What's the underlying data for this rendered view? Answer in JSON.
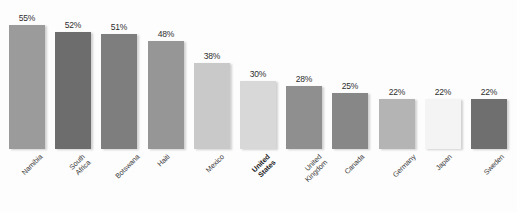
{
  "chart_data": {
    "type": "bar",
    "title": "",
    "subtitle": "",
    "xlabel": "",
    "ylabel": "",
    "ylim": [
      0,
      58
    ],
    "grid": false,
    "legend": "none",
    "orientation": "vertical",
    "value_label_suffix": "%",
    "categories": [
      "Namibia",
      "South Africa",
      "Botswana",
      "Haiti",
      "Mexico",
      "United States",
      "United Kingdom",
      "Canada",
      "Germany",
      "Japan",
      "Sweden"
    ],
    "values": [
      55,
      52,
      51,
      48,
      38,
      30,
      28,
      25,
      22,
      22,
      22
    ],
    "value_labels": [
      "55%",
      "52%",
      "51%",
      "48%",
      "38%",
      "30%",
      "28%",
      "25%",
      "22%",
      "22%",
      "22%"
    ],
    "bar_colors": [
      "#9b9b9b",
      "#6d6d6d",
      "#7e7e7e",
      "#969696",
      "#c9c9c9",
      "#d8d8d8",
      "#8f8f8f",
      "#878787",
      "#b4b4b4",
      "#f4f4f4",
      "#6f6f6f"
    ],
    "highlighted_category": "United States",
    "background_color": "#fdfdfd",
    "value_label_color": "#2e2e2e",
    "axis_label_color": "#3a3a3a"
  }
}
